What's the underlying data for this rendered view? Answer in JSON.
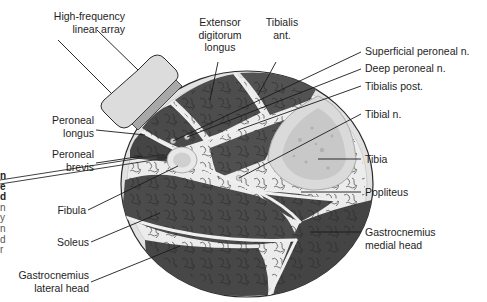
{
  "figure": {
    "type": "cross-sectional anatomical diagram",
    "colors": {
      "muscle": "#4a4a4a",
      "muscle_texture": "#2a2a2a",
      "fascia": "#e6e6e6",
      "skin_outline": "#2b2b2b",
      "bone_cortex": "#d9d9d9",
      "bone_marrow": "#c4c4c4",
      "probe_body": "#dcdcdc",
      "probe_face": "#a8a8a8",
      "leader_line": "#1a1a1a",
      "text": "#1e1e1e"
    }
  },
  "labels": {
    "probe": [
      "High-frequency",
      "linear array"
    ],
    "extensor_digitorum_longus": [
      "Extensor",
      "digitorum",
      "longus"
    ],
    "tibialis_ant": [
      "Tibialis",
      "ant."
    ],
    "superficial_peroneal_n": [
      "Superficial peroneal n."
    ],
    "deep_peroneal_n": [
      "Deep peroneal n."
    ],
    "tibialis_post": [
      "Tibialis post."
    ],
    "tibial_n": [
      "Tibial n."
    ],
    "tibia": [
      "Tibia"
    ],
    "popliteus": [
      "Popliteus"
    ],
    "gastrocnemius_medial": [
      "Gastrocnemius",
      "medial head"
    ],
    "peroneal_longus": [
      "Peroneal",
      "longus"
    ],
    "peroneal_brevis": [
      "Peroneal",
      "brevis"
    ],
    "fibula": [
      "Fibula"
    ],
    "soleus": [
      "Soleus"
    ],
    "gastrocnemius_lateral": [
      "Gastrocnemius",
      "lateral head"
    ]
  },
  "cropped_left_caption": {
    "bold_fragments": [
      "n",
      "e",
      "d"
    ],
    "regular_fragments": [
      "n",
      "y",
      "n",
      "d",
      "r"
    ]
  }
}
